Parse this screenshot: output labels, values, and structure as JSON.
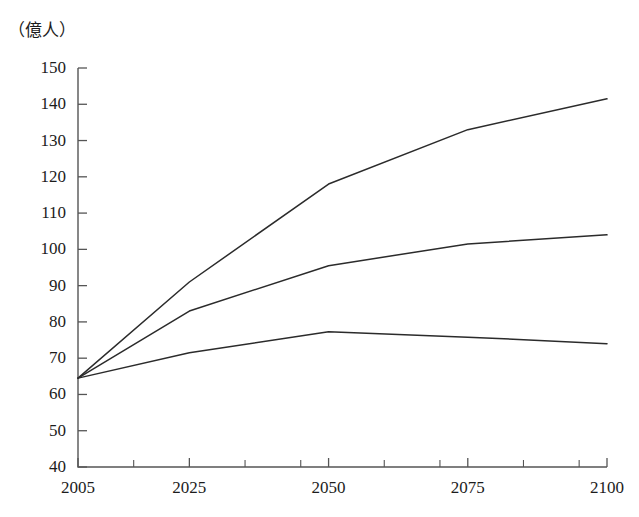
{
  "chart_data": {
    "type": "line",
    "title": "",
    "subtitle": "",
    "xlabel": "",
    "ylabel": "（億人）",
    "unit_note": "（億人）",
    "x": [
      2005,
      2025,
      2050,
      2075,
      2100
    ],
    "xlim": [
      2005,
      2100
    ],
    "ylim": [
      40,
      150
    ],
    "ytick_values": [
      150,
      140,
      130,
      120,
      110,
      100,
      90,
      80,
      70,
      60,
      50,
      40
    ],
    "ytick_labels": [
      "150",
      "140",
      "130",
      "120",
      "110",
      "100",
      "90",
      "80",
      "70",
      "60",
      "50",
      "40"
    ],
    "xtick_values": [
      2005,
      2025,
      2050,
      2075,
      2100
    ],
    "xtick_labels": [
      "2005",
      "2025",
      "2050",
      "2075",
      "2100"
    ],
    "xtick_minor_values": [
      2015,
      2035,
      2045,
      2060,
      2070,
      2085,
      2095
    ],
    "grid": false,
    "legend": "none",
    "series": [
      {
        "name": "high",
        "color": "#2b2b2b",
        "values": [
          64.5,
          91.0,
          118.0,
          133.0,
          141.5
        ]
      },
      {
        "name": "medium",
        "color": "#2b2b2b",
        "values": [
          64.5,
          83.0,
          95.5,
          101.5,
          104.0
        ]
      },
      {
        "name": "low",
        "color": "#2b2b2b",
        "values": [
          64.5,
          71.5,
          77.3,
          75.8,
          74.0
        ]
      }
    ]
  },
  "axis": {
    "frame_color": "#555555",
    "line_color": "#2b2b2b"
  }
}
